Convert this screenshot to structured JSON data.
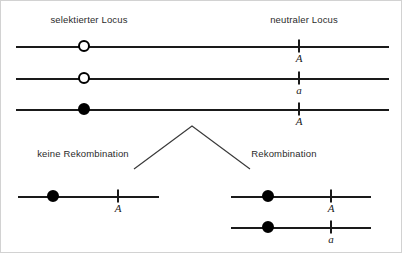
{
  "figure": {
    "width": 402,
    "height": 253,
    "background_color": "#ffffff",
    "line_color": "#1a1a1a",
    "border_color": "#d2d2d2"
  },
  "headers": {
    "left": "selektierter Locus",
    "right": "neutraler Locus"
  },
  "branch_labels": {
    "left": "keine Rekombination",
    "right": "Rekombination"
  },
  "top_rows": [
    {
      "selected_marker": "open-circle",
      "neutral_allele": "A"
    },
    {
      "selected_marker": "open-circle",
      "neutral_allele": "a"
    },
    {
      "selected_marker": "filled-circle",
      "neutral_allele": "A"
    }
  ],
  "bottom_left_rows": [
    {
      "selected_marker": "filled-circle",
      "neutral_allele": "A"
    }
  ],
  "bottom_right_rows": [
    {
      "selected_marker": "filled-circle",
      "neutral_allele": "A"
    },
    {
      "selected_marker": "filled-circle",
      "neutral_allele": "a"
    }
  ]
}
